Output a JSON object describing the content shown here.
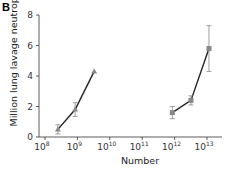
{
  "panel": {
    "label": "B"
  },
  "chart_data": {
    "type": "line",
    "title": "",
    "xlabel": "Number",
    "ylabel": "Million lung lavage neutrophils",
    "xscale": "log",
    "xlim": [
      100000000.0,
      10000000000000.0
    ],
    "ylim": [
      0,
      8
    ],
    "x_tick_labels": [
      "10^8",
      "10^9",
      "10^10",
      "10^11",
      "10^12",
      "10^13"
    ],
    "y_tick_labels": [
      "0",
      "2",
      "4",
      "6",
      "8"
    ],
    "grid": false,
    "legend": null,
    "series": [
      {
        "name": "series-1",
        "marker": "triangle",
        "color": "#888888",
        "x": [
          250000000.0,
          850000000.0,
          3300000000.0
        ],
        "y": [
          0.5,
          1.8,
          4.3
        ],
        "err": [
          0.3,
          0.45,
          0.0
        ]
      },
      {
        "name": "series-2",
        "marker": "square",
        "color": "#888888",
        "x": [
          850000000000.0,
          3200000000000.0,
          11500000000000.0
        ],
        "y": [
          1.6,
          2.4,
          5.8
        ],
        "err": [
          0.4,
          0.3,
          1.5
        ]
      }
    ]
  },
  "axes": {
    "x_ticks": [
      {
        "base": "10",
        "exp": "8"
      },
      {
        "base": "10",
        "exp": "9"
      },
      {
        "base": "10",
        "exp": "10"
      },
      {
        "base": "10",
        "exp": "11"
      },
      {
        "base": "10",
        "exp": "12"
      },
      {
        "base": "10",
        "exp": "13"
      }
    ],
    "y_ticks": [
      "0",
      "2",
      "4",
      "6",
      "8"
    ],
    "xlabel": "Number",
    "ylabel": "Million lung lavage neutrophils"
  }
}
